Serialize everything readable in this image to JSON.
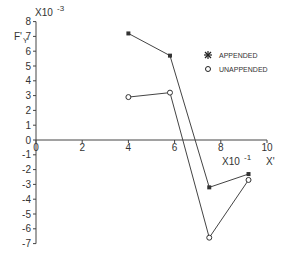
{
  "chart_data": {
    "type": "line",
    "title": "",
    "xlabel": "X'",
    "ylabel": "F'Y",
    "x_multiplier": "X10-1",
    "y_multiplier": "X10-3",
    "xlim": [
      0,
      10
    ],
    "ylim": [
      -7,
      8
    ],
    "x_ticks": [
      0,
      2,
      4,
      6,
      8,
      10
    ],
    "y_ticks": [
      -7,
      -6,
      -5,
      -4,
      -3,
      -2,
      -1,
      0,
      1,
      2,
      3,
      4,
      5,
      6,
      7,
      8
    ],
    "grid": false,
    "legend_position": "upper right",
    "series": [
      {
        "name": "APPENDED",
        "marker": "asterisk",
        "x": [
          4.0,
          5.8,
          7.5,
          9.2
        ],
        "y": [
          7.2,
          5.7,
          -3.2,
          -2.3
        ]
      },
      {
        "name": "UNAPPENDED",
        "marker": "circle",
        "x": [
          4.0,
          5.8,
          7.5,
          9.2
        ],
        "y": [
          2.9,
          3.2,
          -6.6,
          -2.7
        ]
      }
    ]
  },
  "labels": {
    "ylabel_main": "F'",
    "ylabel_sub": "Y",
    "y_mult": "X10",
    "y_exp": "-3",
    "x_mult": "X10",
    "x_exp": "-1",
    "xlabel": "X'",
    "legend_appended": "APPENDED",
    "legend_unappended": "UNAPPENDED"
  }
}
